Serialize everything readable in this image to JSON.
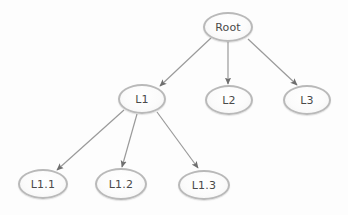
{
  "diagram": {
    "type": "tree",
    "background_color": "#fdfdfd",
    "node_fill_color": "#fbfbfb",
    "node_border_color": "#b9b9b9",
    "edge_color": "#9a9a9a",
    "arrowhead_color": "#6e6e6e",
    "label_color": "#4a4a4a",
    "nodes": [
      {
        "id": "root",
        "label": "Root",
        "cx": 228,
        "cy": 27,
        "rx": 25,
        "ry": 15
      },
      {
        "id": "l1",
        "label": "L1",
        "cx": 142,
        "cy": 99,
        "rx": 24,
        "ry": 15
      },
      {
        "id": "l2",
        "label": "L2",
        "cx": 229,
        "cy": 100,
        "rx": 24,
        "ry": 15
      },
      {
        "id": "l3",
        "label": "L3",
        "cx": 307,
        "cy": 100,
        "rx": 24,
        "ry": 15
      },
      {
        "id": "l1_1",
        "label": "L1.1",
        "cx": 43,
        "cy": 184,
        "rx": 25,
        "ry": 15
      },
      {
        "id": "l1_2",
        "label": "L1.2",
        "cx": 121,
        "cy": 184,
        "rx": 26,
        "ry": 16
      },
      {
        "id": "l1_3",
        "label": "L1.3",
        "cx": 204,
        "cy": 185,
        "rx": 26,
        "ry": 15
      }
    ],
    "edges": [
      {
        "id": "root-l1",
        "from": "root",
        "to": "l1",
        "x1": 211,
        "y1": 38,
        "x2": 160,
        "y2": 86
      },
      {
        "id": "root-l2",
        "from": "root",
        "to": "l2",
        "x1": 228,
        "y1": 42,
        "x2": 228,
        "y2": 84
      },
      {
        "id": "root-l3",
        "from": "root",
        "to": "l3",
        "x1": 248,
        "y1": 39,
        "x2": 297,
        "y2": 85
      },
      {
        "id": "l1-l1_1",
        "from": "l1",
        "to": "l1_1",
        "x1": 124,
        "y1": 110,
        "x2": 57,
        "y2": 170
      },
      {
        "id": "l1-l1_2",
        "from": "l1",
        "to": "l1_2",
        "x1": 137,
        "y1": 114,
        "x2": 122,
        "y2": 167
      },
      {
        "id": "l1-l1_3",
        "from": "l1",
        "to": "l1_3",
        "x1": 157,
        "y1": 112,
        "x2": 198,
        "y2": 168
      }
    ]
  }
}
